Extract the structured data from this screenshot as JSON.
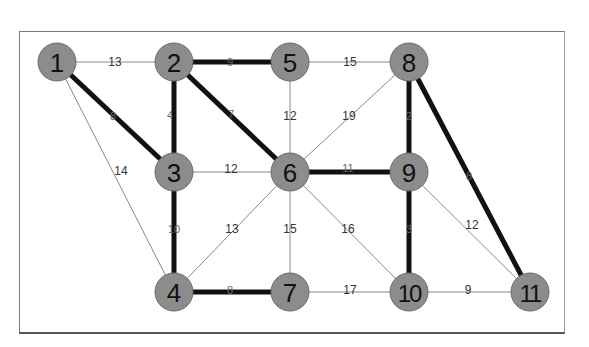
{
  "graph": {
    "type": "weighted-undirected-graph",
    "highlight_note": "bold edges form the highlighted tree",
    "colors": {
      "node_fill": "#8c8c8c",
      "node_stroke": "#6a6a6a",
      "thin_edge": "#888888",
      "bold_edge": "#111111",
      "frame": "#7a7a7a"
    },
    "nodes": [
      {
        "id": "1",
        "x": 57,
        "y": 62
      },
      {
        "id": "2",
        "x": 174,
        "y": 62
      },
      {
        "id": "3",
        "x": 174,
        "y": 172
      },
      {
        "id": "4",
        "x": 174,
        "y": 292
      },
      {
        "id": "5",
        "x": 290,
        "y": 62
      },
      {
        "id": "6",
        "x": 290,
        "y": 172
      },
      {
        "id": "7",
        "x": 290,
        "y": 292
      },
      {
        "id": "8",
        "x": 409,
        "y": 62
      },
      {
        "id": "9",
        "x": 409,
        "y": 172
      },
      {
        "id": "10",
        "x": 409,
        "y": 292
      },
      {
        "id": "11",
        "x": 530,
        "y": 292
      }
    ],
    "edges": [
      {
        "from": "1",
        "to": "2",
        "weight": "13",
        "bold": false,
        "lx": 115,
        "ly": 62
      },
      {
        "from": "1",
        "to": "3",
        "weight": "8",
        "bold": true,
        "lx": 113,
        "ly": 116
      },
      {
        "from": "1",
        "to": "4",
        "weight": "14",
        "bold": false,
        "lx": 121,
        "ly": 171
      },
      {
        "from": "2",
        "to": "5",
        "weight": "9",
        "bold": true,
        "lx": 230,
        "ly": 62
      },
      {
        "from": "2",
        "to": "3",
        "weight": "4",
        "bold": true,
        "lx": 170,
        "ly": 115
      },
      {
        "from": "2",
        "to": "6",
        "weight": "7",
        "bold": true,
        "lx": 231,
        "ly": 114
      },
      {
        "from": "5",
        "to": "8",
        "weight": "15",
        "bold": false,
        "lx": 350,
        "ly": 62
      },
      {
        "from": "5",
        "to": "6",
        "weight": "12",
        "bold": false,
        "lx": 290,
        "ly": 116
      },
      {
        "from": "6",
        "to": "8",
        "weight": "19",
        "bold": false,
        "lx": 349,
        "ly": 116
      },
      {
        "from": "3",
        "to": "6",
        "weight": "12",
        "bold": false,
        "lx": 231,
        "ly": 169
      },
      {
        "from": "6",
        "to": "9",
        "weight": "11",
        "bold": true,
        "lx": 348,
        "ly": 168
      },
      {
        "from": "8",
        "to": "9",
        "weight": "2",
        "bold": true,
        "lx": 409,
        "ly": 116
      },
      {
        "from": "8",
        "to": "11",
        "weight": "8",
        "bold": true,
        "lx": 469,
        "ly": 176
      },
      {
        "from": "3",
        "to": "4",
        "weight": "10",
        "bold": true,
        "lx": 174,
        "ly": 229
      },
      {
        "from": "4",
        "to": "6",
        "weight": "13",
        "bold": false,
        "lx": 232,
        "ly": 229
      },
      {
        "from": "6",
        "to": "7",
        "weight": "15",
        "bold": false,
        "lx": 290,
        "ly": 229
      },
      {
        "from": "6",
        "to": "10",
        "weight": "16",
        "bold": false,
        "lx": 348,
        "ly": 229
      },
      {
        "from": "9",
        "to": "10",
        "weight": "3",
        "bold": true,
        "lx": 409,
        "ly": 229
      },
      {
        "from": "9",
        "to": "11",
        "weight": "12",
        "bold": false,
        "lx": 472,
        "ly": 225
      },
      {
        "from": "4",
        "to": "7",
        "weight": "8",
        "bold": true,
        "lx": 230,
        "ly": 290
      },
      {
        "from": "7",
        "to": "10",
        "weight": "17",
        "bold": false,
        "lx": 350,
        "ly": 290
      },
      {
        "from": "10",
        "to": "11",
        "weight": "9",
        "bold": false,
        "lx": 468,
        "ly": 290
      }
    ]
  }
}
